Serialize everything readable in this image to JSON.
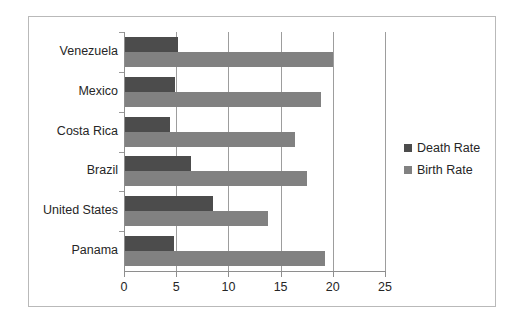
{
  "chart_data": {
    "type": "bar",
    "orientation": "horizontal",
    "title": "",
    "xlabel": "",
    "ylabel": "",
    "categories": [
      "Venezuela",
      "Mexico",
      "Costa Rica",
      "Brazil",
      "United States",
      "Panama"
    ],
    "series": [
      {
        "name": "Death Rate",
        "color": "#4c4c4c",
        "values": [
          5.1,
          4.8,
          4.3,
          6.3,
          8.4,
          4.7
        ]
      },
      {
        "name": "Birth Rate",
        "color": "#818181",
        "values": [
          19.9,
          18.8,
          16.3,
          17.4,
          13.7,
          19.2
        ]
      }
    ],
    "xlim": [
      0,
      25
    ],
    "xticks": [
      0,
      5,
      10,
      15,
      20,
      25
    ],
    "xtick_labels": [
      "0",
      "5",
      "10",
      "15",
      "20",
      "25"
    ],
    "grid": "vertical",
    "legend_position": "right",
    "legend_entries": [
      "Death Rate",
      "Birth Rate"
    ],
    "frame": true
  }
}
